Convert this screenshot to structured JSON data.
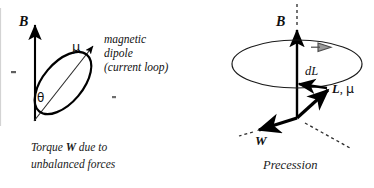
{
  "figure": {
    "title_present": false,
    "panels": [
      {
        "id": "torque",
        "name": "magnetic-dipole-torque",
        "caption_line1_prefix": "Torque ",
        "caption_line1_bold": "W",
        "caption_line1_suffix": " due to",
        "caption_line2": "unbalanced forces",
        "labels": {
          "field_vector": "B",
          "moment_vector": "μ",
          "angle": "θ",
          "annotation_line1": "magnetic",
          "annotation_line2": "dipole",
          "annotation_line3": "(current loop)"
        }
      },
      {
        "id": "precession",
        "name": "precession-diagram",
        "caption": "Precession",
        "labels": {
          "field_vector": "B",
          "angular_momentum_change": "dL",
          "angular_momentum_and_moment_bold": "L",
          "angular_momentum_and_moment_rest": ", ",
          "angular_momentum_and_moment_greek": "μ",
          "torque_vector": "W"
        }
      }
    ]
  },
  "colors": {
    "ink": "#101010",
    "stroke": "#000000",
    "thin_stroke": "#1a1a1a",
    "precession_arrow_fill": "#9a9a9a",
    "precession_arrow_stroke": "#4a4a4a",
    "dashed": "#2a2a2a",
    "background": "#ffffff",
    "edge_rule": "#3a3a3a"
  }
}
